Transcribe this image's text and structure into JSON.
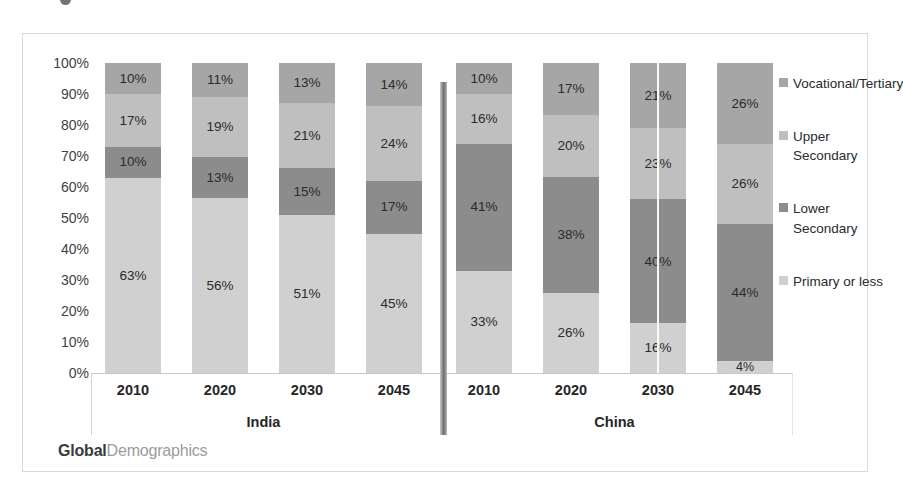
{
  "branding": {
    "strong": "Global",
    "light": "Demographics"
  },
  "legend": {
    "position": "right",
    "items": [
      {
        "label": "Vocational/Tertiary",
        "color": "#a6a6a6"
      },
      {
        "label": "Upper Secondary",
        "color": "#bfbfbf"
      },
      {
        "label": "Lower Secondary",
        "color": "#8c8c8c"
      },
      {
        "label": "Primary or less",
        "color": "#d0d0d0"
      }
    ]
  },
  "chart_data": {
    "type": "bar",
    "subtype": "stacked-100-percent",
    "title": "",
    "xlabel": "",
    "ylabel": "",
    "ylim": [
      0,
      100
    ],
    "grid": false,
    "y_ticks": [
      "0%",
      "10%",
      "20%",
      "30%",
      "40%",
      "50%",
      "60%",
      "70%",
      "80%",
      "90%",
      "100%"
    ],
    "groups": [
      "India",
      "China"
    ],
    "categories": [
      "2010",
      "2020",
      "2030",
      "2045",
      "2010",
      "2020",
      "2030",
      "2045"
    ],
    "series": [
      {
        "name": "Primary or less",
        "color": "#d0d0d0",
        "values": [
          63,
          56,
          51,
          45,
          33,
          26,
          16,
          4
        ],
        "labels": [
          "63%",
          "56%",
          "51%",
          "45%",
          "33%",
          "26%",
          "16%",
          "4%"
        ]
      },
      {
        "name": "Lower Secondary",
        "color": "#8c8c8c",
        "values": [
          10,
          13,
          15,
          17,
          41,
          38,
          40,
          44
        ],
        "labels": [
          "10%",
          "13%",
          "15%",
          "17%",
          "41%",
          "38%",
          "40%",
          "44%"
        ]
      },
      {
        "name": "Upper Secondary",
        "color": "#bfbfbf",
        "values": [
          17,
          19,
          21,
          24,
          16,
          20,
          23,
          26
        ],
        "labels": [
          "17%",
          "19%",
          "21%",
          "24%",
          "16%",
          "20%",
          "23%",
          "26%"
        ]
      },
      {
        "name": "Vocational/Tertiary",
        "color": "#a6a6a6",
        "values": [
          10,
          11,
          13,
          14,
          10,
          17,
          21,
          26
        ],
        "labels": [
          "10%",
          "11%",
          "13%",
          "14%",
          "10%",
          "17%",
          "21%",
          "26%"
        ]
      }
    ]
  }
}
